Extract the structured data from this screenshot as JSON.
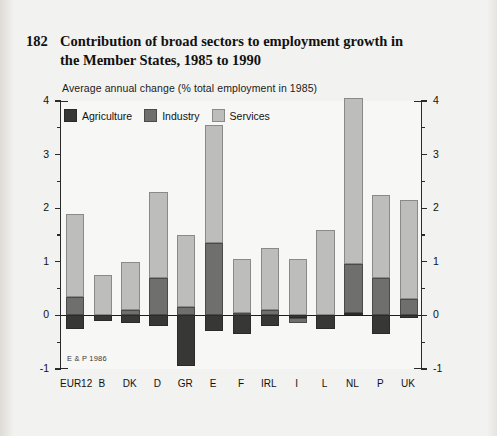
{
  "figure": {
    "number": "182",
    "title_line1": "Contribution of broad sectors to employment growth in",
    "title_line2": "the Member States, 1985 to 1990",
    "subtitle": "Average annual change (% total employment in 1985)",
    "source": "E & P 1986"
  },
  "legend": {
    "position": "top-left-inside",
    "items": [
      {
        "label": "Agriculture",
        "color": "#373735",
        "key": "agriculture"
      },
      {
        "label": "Industry",
        "color": "#6f6f6d",
        "key": "industry"
      },
      {
        "label": "Services",
        "color": "#bdbdbb",
        "key": "services"
      }
    ]
  },
  "axes": {
    "y_ticks": [
      "4",
      "3",
      "2",
      "1",
      "0",
      "-1"
    ],
    "y_minor_step": 0.5,
    "ylim": [
      -1,
      4
    ],
    "left_axis": true,
    "right_axis": true,
    "zero_line": true,
    "grid": false
  },
  "chart_data": {
    "type": "bar",
    "stacked": true,
    "title": "Contribution of broad sectors to employment growth in the Member States, 1985 to 1990",
    "subtitle": "Average annual change (% total employment in 1985)",
    "xlabel": "",
    "ylabel": "Average annual change (% total employment in 1985)",
    "ylim": [
      -1,
      4
    ],
    "categories": [
      "EUR12",
      "B",
      "DK",
      "D",
      "GR",
      "E",
      "F",
      "IRL",
      "I",
      "L",
      "NL",
      "P",
      "UK"
    ],
    "series": [
      {
        "name": "Agriculture",
        "color": "#373735",
        "values": [
          -0.25,
          -0.1,
          -0.15,
          -0.2,
          -0.95,
          -0.3,
          -0.35,
          -0.2,
          -0.05,
          -0.25,
          0.05,
          -0.35,
          -0.05
        ]
      },
      {
        "name": "Industry",
        "color": "#6f6f6d",
        "values": [
          0.35,
          0.0,
          0.1,
          0.7,
          0.15,
          1.35,
          0.05,
          0.1,
          -0.1,
          0.0,
          0.9,
          0.7,
          0.3
        ]
      },
      {
        "name": "Services",
        "color": "#bdbdbb",
        "values": [
          1.55,
          0.75,
          0.9,
          1.6,
          1.35,
          2.2,
          1.0,
          1.15,
          1.05,
          1.6,
          3.1,
          1.55,
          1.85
        ]
      }
    ],
    "totals": [
      1.9,
      0.75,
      1.0,
      2.3,
      1.5,
      3.55,
      1.05,
      1.25,
      0.95,
      1.6,
      4.0,
      2.25,
      2.15
    ]
  }
}
